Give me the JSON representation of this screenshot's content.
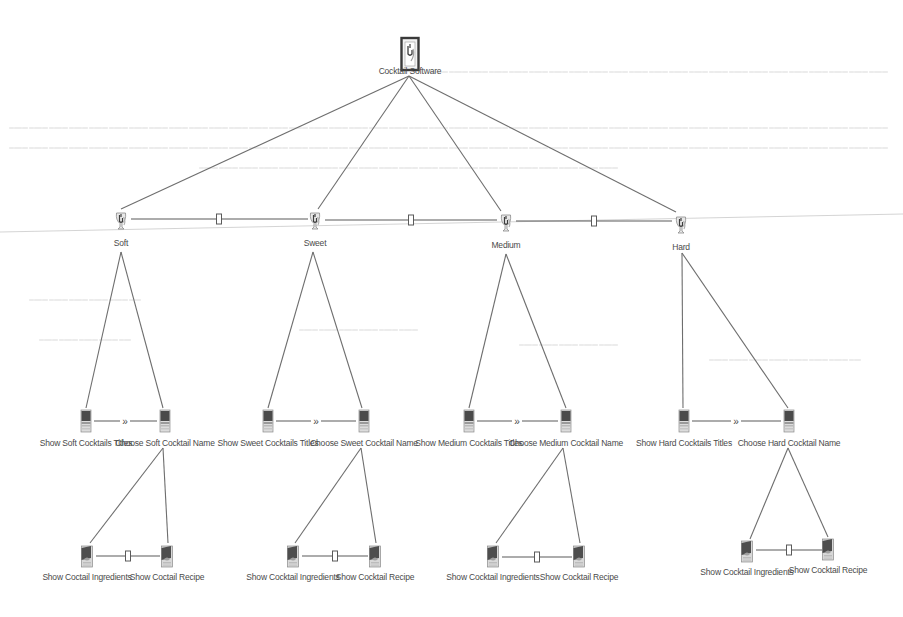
{
  "diagram": {
    "title": "Cocktail Software",
    "type": "feature-tree",
    "colors": {
      "background": "#ffffff",
      "edge": "#6e6e6e",
      "label": "#4a4a4a",
      "icon_dark": "#4d4d4d",
      "icon_frame": "#3a3a3a"
    },
    "nodes": [
      {
        "id": "root",
        "label": "Cocktail Software",
        "icon": "framed-cocktail-icon",
        "x": 410,
        "y": 55,
        "level": 0
      },
      {
        "id": "soft",
        "label": "Soft",
        "icon": "cocktail-glass-icon",
        "x": 121,
        "y": 221,
        "level": 1
      },
      {
        "id": "sweet",
        "label": "Sweet",
        "icon": "cocktail-glass-icon",
        "x": 315,
        "y": 221,
        "level": 1
      },
      {
        "id": "medium",
        "label": "Medium",
        "icon": "cocktail-glass-icon",
        "x": 506,
        "y": 223,
        "level": 1
      },
      {
        "id": "hard",
        "label": "Hard",
        "icon": "cocktail-glass-icon",
        "x": 681,
        "y": 225,
        "level": 1
      },
      {
        "id": "soft_titles",
        "label": "Show Soft Cocktails Titles",
        "icon": "screen-page-icon",
        "x": 86,
        "y": 421,
        "level": 2
      },
      {
        "id": "soft_name",
        "label": "Choose Soft Cocktail Name",
        "icon": "screen-page-icon",
        "x": 165,
        "y": 421,
        "level": 2
      },
      {
        "id": "sweet_titles",
        "label": "Show Sweet Cocktails Titles",
        "icon": "screen-page-icon",
        "x": 268,
        "y": 421,
        "level": 2
      },
      {
        "id": "sweet_name",
        "label": "Choose Sweet Cocktail Name",
        "icon": "screen-page-icon",
        "x": 364,
        "y": 421,
        "level": 2
      },
      {
        "id": "medium_titles",
        "label": "Show Medium Cocktails Titles",
        "icon": "screen-page-icon",
        "x": 469,
        "y": 421,
        "level": 2
      },
      {
        "id": "medium_name",
        "label": "Choose Medium Cocktail Name",
        "icon": "screen-page-icon",
        "x": 566,
        "y": 421,
        "level": 2
      },
      {
        "id": "hard_titles",
        "label": "Show Hard Cocktails Titles",
        "icon": "screen-page-icon",
        "x": 684,
        "y": 421,
        "level": 2
      },
      {
        "id": "hard_name",
        "label": "Choose Hard Cocktail Name",
        "icon": "screen-page-icon",
        "x": 789,
        "y": 421,
        "level": 2
      },
      {
        "id": "soft_ingr",
        "label": "Show Coctail Ingredients",
        "icon": "recipe-card-icon",
        "x": 87,
        "y": 556,
        "level": 3
      },
      {
        "id": "soft_recipe",
        "label": "Show Coctail Recipe",
        "icon": "recipe-card-icon",
        "x": 167,
        "y": 556,
        "level": 3
      },
      {
        "id": "sweet_ingr",
        "label": "Show Cocktail Ingredients",
        "icon": "recipe-card-icon",
        "x": 293,
        "y": 556,
        "level": 3
      },
      {
        "id": "sweet_recipe",
        "label": "Show Cocktail Recipe",
        "icon": "recipe-card-icon",
        "x": 375,
        "y": 556,
        "level": 3
      },
      {
        "id": "medium_ingr",
        "label": "Show Cocktail Ingredients",
        "icon": "recipe-card-icon",
        "x": 493,
        "y": 556,
        "level": 3
      },
      {
        "id": "medium_recipe",
        "label": "Show Cocktail Recipe",
        "icon": "recipe-card-icon",
        "x": 579,
        "y": 556,
        "level": 3
      },
      {
        "id": "hard_ingr",
        "label": "Show Cocktail Ingredients",
        "icon": "recipe-card-icon",
        "x": 747,
        "y": 551,
        "level": 3
      },
      {
        "id": "hard_recipe",
        "label": "Show Cocktail Recipe",
        "icon": "recipe-card-icon",
        "x": 828,
        "y": 549,
        "level": 3
      }
    ],
    "tree_edges": [
      {
        "from": "root",
        "to": "soft",
        "from_xy": [
          409,
          76
        ],
        "to_xy": [
          121,
          209
        ]
      },
      {
        "from": "root",
        "to": "sweet",
        "from_xy": [
          409,
          76
        ],
        "to_xy": [
          318,
          209
        ]
      },
      {
        "from": "root",
        "to": "medium",
        "from_xy": [
          409,
          76
        ],
        "to_xy": [
          501,
          211
        ]
      },
      {
        "from": "root",
        "to": "hard",
        "from_xy": [
          409,
          76
        ],
        "to_xy": [
          676,
          212
        ]
      },
      {
        "from": "soft",
        "to": "soft_titles",
        "from_xy": [
          121,
          252
        ],
        "to_xy": [
          86,
          408
        ]
      },
      {
        "from": "soft",
        "to": "soft_name",
        "from_xy": [
          121,
          252
        ],
        "to_xy": [
          163,
          408
        ]
      },
      {
        "from": "sweet",
        "to": "sweet_titles",
        "from_xy": [
          313,
          252
        ],
        "to_xy": [
          268,
          408
        ]
      },
      {
        "from": "sweet",
        "to": "sweet_name",
        "from_xy": [
          313,
          252
        ],
        "to_xy": [
          362,
          408
        ]
      },
      {
        "from": "medium",
        "to": "medium_titles",
        "from_xy": [
          506,
          254
        ],
        "to_xy": [
          469,
          408
        ]
      },
      {
        "from": "medium",
        "to": "medium_name",
        "from_xy": [
          506,
          254
        ],
        "to_xy": [
          566,
          408
        ]
      },
      {
        "from": "hard",
        "to": "hard_titles",
        "from_xy": [
          682,
          253
        ],
        "to_xy": [
          683,
          408
        ]
      },
      {
        "from": "hard",
        "to": "hard_name",
        "from_xy": [
          682,
          253
        ],
        "to_xy": [
          788,
          408
        ]
      },
      {
        "from": "soft_name",
        "to": "soft_ingr",
        "from_xy": [
          163,
          448
        ],
        "to_xy": [
          90,
          543
        ]
      },
      {
        "from": "soft_name",
        "to": "soft_recipe",
        "from_xy": [
          163,
          448
        ],
        "to_xy": [
          168,
          543
        ]
      },
      {
        "from": "sweet_name",
        "to": "sweet_ingr",
        "from_xy": [
          361,
          448
        ],
        "to_xy": [
          295,
          543
        ]
      },
      {
        "from": "sweet_name",
        "to": "sweet_recipe",
        "from_xy": [
          361,
          448
        ],
        "to_xy": [
          376,
          543
        ]
      },
      {
        "from": "medium_name",
        "to": "medium_ingr",
        "from_xy": [
          563,
          448
        ],
        "to_xy": [
          496,
          543
        ]
      },
      {
        "from": "medium_name",
        "to": "medium_recipe",
        "from_xy": [
          563,
          448
        ],
        "to_xy": [
          580,
          543
        ]
      },
      {
        "from": "hard_name",
        "to": "hard_ingr",
        "from_xy": [
          788,
          448
        ],
        "to_xy": [
          750,
          539
        ]
      },
      {
        "from": "hard_name",
        "to": "hard_recipe",
        "from_xy": [
          788,
          448
        ],
        "to_xy": [
          828,
          537
        ]
      }
    ],
    "sibling_connectors": [
      {
        "from": "soft",
        "to": "sweet",
        "kind": "rect-marker",
        "x1": 131,
        "x2": 308,
        "y": 219,
        "marker_x": 219
      },
      {
        "from": "sweet",
        "to": "medium",
        "kind": "rect-marker",
        "x1": 325,
        "x2": 497,
        "y": 220,
        "marker_x": 411
      },
      {
        "from": "medium",
        "to": "hard",
        "kind": "rect-marker",
        "x1": 516,
        "x2": 672,
        "y": 221,
        "marker_x": 594
      },
      {
        "from": "soft_titles",
        "to": "soft_name",
        "kind": "chevron",
        "x1": 94,
        "x2": 157,
        "y": 421,
        "marker_x": 125,
        "glyph": "»"
      },
      {
        "from": "sweet_titles",
        "to": "sweet_name",
        "kind": "chevron",
        "x1": 276,
        "x2": 356,
        "y": 421,
        "marker_x": 316,
        "glyph": "»"
      },
      {
        "from": "medium_titles",
        "to": "medium_name",
        "kind": "chevron",
        "x1": 477,
        "x2": 558,
        "y": 421,
        "marker_x": 517,
        "glyph": "»"
      },
      {
        "from": "hard_titles",
        "to": "hard_name",
        "kind": "chevron",
        "x1": 692,
        "x2": 781,
        "y": 421,
        "marker_x": 736,
        "glyph": "»"
      },
      {
        "from": "soft_ingr",
        "to": "soft_recipe",
        "kind": "rect-marker",
        "x1": 96,
        "x2": 160,
        "y": 556,
        "marker_x": 128
      },
      {
        "from": "sweet_ingr",
        "to": "sweet_recipe",
        "kind": "rect-marker",
        "x1": 302,
        "x2": 368,
        "y": 556,
        "marker_x": 335
      },
      {
        "from": "medium_ingr",
        "to": "medium_recipe",
        "kind": "rect-marker",
        "x1": 502,
        "x2": 572,
        "y": 557,
        "marker_x": 537
      },
      {
        "from": "hard_ingr",
        "to": "hard_recipe",
        "kind": "rect-marker",
        "x1": 756,
        "x2": 822,
        "y": 550,
        "marker_x": 789
      }
    ],
    "label_offsets": {
      "level0": 19,
      "level1": 25,
      "level2": 25,
      "level3": 24
    }
  }
}
